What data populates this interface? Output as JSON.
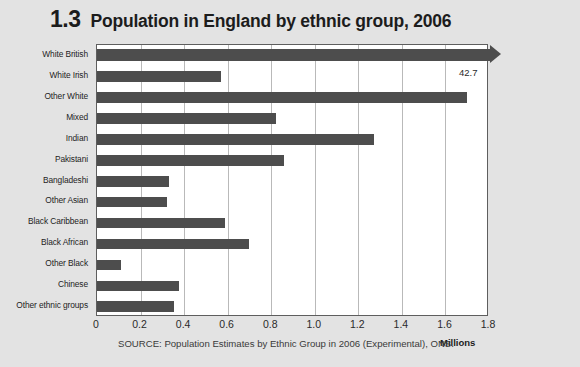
{
  "figure": {
    "number": "1.3",
    "title": "Population in England by ethnic group, 2006",
    "source": "SOURCE: Population Estimates by Ethnic Group in 2006 (Experimental), ONS.",
    "axis_unit": "Millions"
  },
  "colors": {
    "background": "#e3e3e3",
    "plot_background": "#ffffff",
    "bar": "#4d4d4d",
    "gridline": "#b9b9b9",
    "frame": "#5e5e5e",
    "text": "#1c1c1c"
  },
  "chart_data": {
    "type": "bar",
    "orientation": "horizontal",
    "title": "Population in England by ethnic group, 2006",
    "xlabel": "Millions",
    "ylabel": "",
    "xlim": [
      0,
      1.8
    ],
    "grid": true,
    "legend": false,
    "categories": [
      "White British",
      "White Irish",
      "Other White",
      "Mixed",
      "Indian",
      "Pakistani",
      "Bangladeshi",
      "Other Asian",
      "Black Caribbean",
      "Black African",
      "Other Black",
      "Chinese",
      "Other ethnic groups"
    ],
    "values": [
      42.7,
      0.57,
      1.7,
      0.82,
      1.27,
      0.86,
      0.33,
      0.32,
      0.59,
      0.7,
      0.11,
      0.375,
      0.355
    ],
    "xticks": [
      "0",
      "0.2",
      "0.4",
      "0.6",
      "0.8",
      "1.0",
      "1.2",
      "1.4",
      "1.6",
      "1.8"
    ],
    "xtick_values": [
      0,
      0.2,
      0.4,
      0.6,
      0.8,
      1.0,
      1.2,
      1.4,
      1.6,
      1.8
    ],
    "annotations": [
      {
        "category": "White British",
        "label": "42.7",
        "note": "bar truncated with arrowhead, value exceeds axis"
      }
    ]
  }
}
